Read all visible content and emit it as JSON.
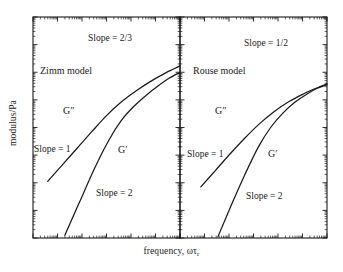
{
  "figure": {
    "background_color": "#ffffff",
    "ink_color": "#1a1a1a",
    "width": 343,
    "height": 272
  },
  "axes": {
    "ylabel": "modulus/Pa",
    "xlabel_main": "frequency, ωτ",
    "xlabel_subscript": "r",
    "tick_style": "logarithmic-minor-ticks",
    "tick_labels_visible": "none",
    "frame": "box-all-four-sides"
  },
  "panels": [
    {
      "id": "zimm",
      "title": "Zimm model",
      "title_pos": {
        "x": 40,
        "y": 74
      },
      "annotations": [
        {
          "name": "slope-high-frequency",
          "text": "Slope = 2/3",
          "x": 88,
          "y": 41
        },
        {
          "name": "slope-terminal-gpp",
          "text": "Slope = 1",
          "x": 34,
          "y": 152
        },
        {
          "name": "slope-terminal-gp",
          "text": "Slope = 2",
          "x": 96,
          "y": 196
        },
        {
          "name": "curve-label-gpp",
          "text": "G″",
          "x": 63,
          "y": 114
        },
        {
          "name": "curve-label-gp",
          "text": "G′",
          "x": 118,
          "y": 153
        }
      ]
    },
    {
      "id": "rouse",
      "title": "Rouse model",
      "title_pos": {
        "x": 193,
        "y": 74
      },
      "annotations": [
        {
          "name": "slope-high-frequency",
          "text": "Slope = 1/2",
          "x": 244,
          "y": 46
        },
        {
          "name": "slope-terminal-gpp",
          "text": "Slope = 1",
          "x": 187,
          "y": 157
        },
        {
          "name": "slope-terminal-gp",
          "text": "Slope = 2",
          "x": 246,
          "y": 199
        },
        {
          "name": "curve-label-gpp",
          "text": "G″",
          "x": 215,
          "y": 114
        },
        {
          "name": "curve-label-gp",
          "text": "G′",
          "x": 268,
          "y": 157
        }
      ]
    }
  ],
  "chart_data": {
    "type": "line",
    "title": "",
    "xlabel": "frequency, ωτr",
    "ylabel": "modulus/Pa",
    "xscale": "log",
    "yscale": "log",
    "grid": false,
    "legend": "inline-curve-labels",
    "axis_tick_labels": "none",
    "xlim_decades": 6,
    "ylim_decades": 8,
    "panels": [
      {
        "name": "Zimm model",
        "terminal_slopes": {
          "G_prime": 2,
          "G_double_prime": 1
        },
        "high_frequency_slope": 0.6667,
        "high_frequency_slope_text": "2/3",
        "series": [
          {
            "name": "G″",
            "points_logx_logy": [
              [
                0.6,
                2.05
              ],
              [
                1.2,
                2.65
              ],
              [
                1.8,
                3.25
              ],
              [
                2.4,
                3.85
              ],
              [
                3.0,
                4.43
              ],
              [
                3.6,
                4.92
              ],
              [
                4.2,
                5.32
              ],
              [
                4.8,
                5.67
              ],
              [
                5.4,
                5.97
              ],
              [
                6.0,
                6.23
              ]
            ]
          },
          {
            "name": "G′",
            "points_logx_logy": [
              [
                1.3,
                0.1
              ],
              [
                1.9,
                1.3
              ],
              [
                2.5,
                2.5
              ],
              [
                3.1,
                3.55
              ],
              [
                3.6,
                4.25
              ],
              [
                4.1,
                4.75
              ],
              [
                4.6,
                5.15
              ],
              [
                5.1,
                5.5
              ],
              [
                5.55,
                5.78
              ],
              [
                6.0,
                6.0
              ]
            ]
          }
        ]
      },
      {
        "name": "Rouse model",
        "terminal_slopes": {
          "G_prime": 2,
          "G_double_prime": 1
        },
        "high_frequency_slope": 0.5,
        "high_frequency_slope_text": "1/2",
        "series": [
          {
            "name": "G″",
            "points_logx_logy": [
              [
                0.85,
                1.85
              ],
              [
                1.45,
                2.45
              ],
              [
                2.05,
                3.05
              ],
              [
                2.65,
                3.62
              ],
              [
                3.25,
                4.14
              ],
              [
                3.85,
                4.58
              ],
              [
                4.45,
                4.94
              ],
              [
                5.05,
                5.22
              ],
              [
                5.55,
                5.42
              ],
              [
                6.0,
                5.58
              ]
            ]
          },
          {
            "name": "G′",
            "points_logx_logy": [
              [
                1.55,
                0.05
              ],
              [
                2.1,
                1.2
              ],
              [
                2.65,
                2.3
              ],
              [
                3.2,
                3.3
              ],
              [
                3.7,
                4.0
              ],
              [
                4.2,
                4.52
              ],
              [
                4.7,
                4.92
              ],
              [
                5.2,
                5.22
              ],
              [
                5.6,
                5.42
              ],
              [
                6.0,
                5.55
              ]
            ]
          }
        ]
      }
    ]
  }
}
